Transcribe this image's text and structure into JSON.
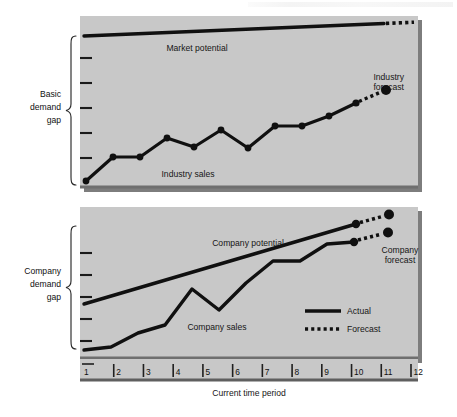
{
  "figure": {
    "title_header": "",
    "x_axis_label": "Current time period",
    "x_ticks": [
      "1",
      "2",
      "3",
      "4",
      "5",
      "6",
      "7",
      "8",
      "9",
      "10",
      "11",
      "12"
    ],
    "braces": {
      "upper_line1": "Basic",
      "upper_line2": "demand",
      "upper_line3": "gap",
      "lower_line1": "Company",
      "lower_line2": "demand",
      "lower_line3": "gap"
    },
    "upper_panel": {
      "market_potential_label": "Market potential",
      "industry_sales_label": "Industry sales",
      "industry_forecast_label_l1": "Industry",
      "industry_forecast_label_l2": "forecast"
    },
    "lower_panel": {
      "company_potential_label": "Company potential",
      "company_sales_label": "Company sales",
      "company_forecast_label_l1": "Company",
      "company_forecast_label_l2": "forecast"
    },
    "legend": {
      "actual_label": "Actual",
      "forecast_label": "Forecast"
    },
    "colors": {
      "panel_fill": "#c8c8c8",
      "panel_shadow": "#7a7a7a",
      "line": "#101010",
      "page_bg": "#ffffff",
      "text": "#161616"
    }
  },
  "chart_data": {
    "type": "line",
    "title": "",
    "xlabel": "Current time period",
    "ylabel": "",
    "x": [
      1,
      2,
      3,
      4,
      5,
      6,
      7,
      8,
      9,
      10,
      11,
      12
    ],
    "xlim": [
      1,
      12
    ],
    "grid": false,
    "legend": [
      "Actual",
      "Forecast"
    ],
    "legend_position": "inside-lower-right",
    "panels": [
      {
        "name": "Basic demand gap",
        "ylim": [
          0,
          10
        ],
        "series": [
          {
            "name": "Market potential",
            "style": "actual",
            "x": [
              1,
              2,
              3,
              4,
              5,
              6,
              7,
              8,
              9,
              10,
              11
            ],
            "values": [
              8.45,
              8.58,
              8.7,
              8.83,
              8.95,
              9.08,
              9.2,
              9.33,
              9.45,
              9.58,
              9.7
            ]
          },
          {
            "name": "Market potential (forecast)",
            "style": "forecast",
            "x": [
              11,
              12
            ],
            "values": [
              9.7,
              9.83
            ]
          },
          {
            "name": "Industry sales",
            "style": "actual",
            "x": [
              1,
              2,
              3,
              4,
              5,
              6,
              7,
              8,
              9,
              10,
              11
            ],
            "values": [
              0.45,
              2.15,
              2.15,
              3.45,
              2.85,
              4.05,
              2.8,
              4.3,
              4.3,
              5.05,
              5.95
            ]
          },
          {
            "name": "Industry forecast",
            "style": "forecast",
            "x": [
              11,
              12
            ],
            "values": [
              5.95,
              6.85
            ]
          }
        ]
      },
      {
        "name": "Company demand gap",
        "ylim": [
          0,
          10
        ],
        "series": [
          {
            "name": "Company potential",
            "style": "actual",
            "x": [
              1,
              11
            ],
            "values": [
              3.55,
              9.25
            ]
          },
          {
            "name": "Company potential (forecast)",
            "style": "forecast",
            "x": [
              11,
              12
            ],
            "values": [
              9.25,
              9.8
            ]
          },
          {
            "name": "Company sales",
            "style": "actual",
            "x": [
              1,
              2,
              3,
              4,
              5,
              6,
              7,
              8,
              9,
              10,
              11
            ],
            "values": [
              0.55,
              0.75,
              1.75,
              2.35,
              4.95,
              3.45,
              5.35,
              6.95,
              6.95,
              8.15,
              8.3
            ]
          },
          {
            "name": "Company forecast",
            "style": "forecast",
            "x": [
              11,
              12
            ],
            "values": [
              8.3,
              8.95
            ]
          }
        ]
      }
    ]
  }
}
